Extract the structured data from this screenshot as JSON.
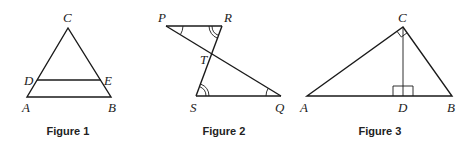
{
  "figures": [
    {
      "caption": "Figure 1",
      "labels": {
        "C": "C",
        "D": "D",
        "E": "E",
        "A": "A",
        "B": "B"
      }
    },
    {
      "caption": "Figure 2",
      "labels": {
        "P": "P",
        "R": "R",
        "T": "T",
        "S": "S",
        "Q": "Q"
      }
    },
    {
      "caption": "Figure 3",
      "labels": {
        "C": "C",
        "A": "A",
        "D": "D",
        "B": "B"
      }
    }
  ],
  "colors": {
    "stroke": "#1a1a1a",
    "text": "#222222",
    "background": "#ffffff"
  }
}
